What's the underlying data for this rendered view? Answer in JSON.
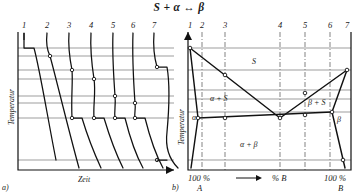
{
  "figure": {
    "title": "S + α ↔ β",
    "panel_a_label": "a)",
    "panel_b_label": "b)"
  },
  "panel_a": {
    "name": "cooling-curves",
    "y_axis_label": "Temperatur",
    "x_axis_label": "Zeit",
    "x_axis_arrow": true,
    "curve_numbers": [
      "1",
      "2",
      "3",
      "4",
      "5",
      "6",
      "7"
    ],
    "curve_number_x": [
      24,
      47,
      69,
      91,
      113,
      133,
      154
    ],
    "axis": {
      "x0": 18,
      "y0": 32,
      "x1": 174,
      "y1": 170
    },
    "curves": [
      {
        "id": "1",
        "start_x": 24,
        "break_y": 48,
        "arrest_end_x": 34,
        "end_x": 56,
        "end_y": 160
      },
      {
        "id": "2",
        "start_x": 47,
        "break_y": 56,
        "arrest_end_x": 57,
        "end_x": 79,
        "end_y": 168
      },
      {
        "id": "3",
        "start_x": 69,
        "break_y": 70,
        "arrest_end_x": 79,
        "end_x": 101,
        "end_y": 168
      },
      {
        "id": "4",
        "start_x": 91,
        "break_y": 79,
        "arrest_end_x": 101,
        "end_x": 123,
        "end_y": 168
      },
      {
        "id": "5",
        "start_x": 113,
        "break_y": 96,
        "arrest_end_x": 123,
        "end_x": 143,
        "end_y": 168
      },
      {
        "id": "6",
        "start_x": 133,
        "break_y": 103,
        "arrest_end_x": 143,
        "end_x": 163,
        "end_y": 168
      },
      {
        "id": "7",
        "start_x": 154,
        "break_y": 67,
        "arrest_end_x": 164,
        "end_x": 178,
        "end_y": 168
      }
    ]
  },
  "panel_b": {
    "name": "phase-diagram",
    "y_axis_label": "Temperatur",
    "x_axis_label": "% B",
    "x_axis_arrow": true,
    "left_end_label_top": "100 %",
    "left_end_label_bottom": "A",
    "right_end_label_top": "100 %",
    "right_end_label_bottom": "B",
    "alloy_numbers": [
      "1",
      "2",
      "3",
      "4",
      "5",
      "6",
      "7"
    ],
    "alloy_number_x": [
      190,
      202,
      225,
      280,
      305,
      330,
      346
    ],
    "phase_regions": [
      {
        "label": "S",
        "x": 252,
        "y": 64
      },
      {
        "label": "α + S",
        "x": 215,
        "y": 99
      },
      {
        "label": "β + S",
        "x": 313,
        "y": 103
      },
      {
        "label": "α",
        "x": 194,
        "y": 118
      },
      {
        "label": "β",
        "x": 338,
        "y": 120
      },
      {
        "label": "α + β",
        "x": 245,
        "y": 145
      }
    ],
    "box": {
      "x0": 188,
      "y0": 32,
      "x1": 351,
      "y1": 170
    },
    "liquidus_left": [
      [
        190,
        48
      ],
      [
        280,
        118
      ]
    ],
    "liquidus_right": [
      [
        280,
        118
      ],
      [
        347,
        70
      ]
    ],
    "solidus_left": [
      [
        190,
        48
      ],
      [
        198,
        118
      ]
    ],
    "solidus_right": [
      [
        347,
        70
      ],
      [
        332,
        112
      ]
    ],
    "eutectic_line": [
      [
        198,
        118
      ],
      [
        332,
        112
      ]
    ],
    "solvus_left": [
      [
        198,
        118
      ],
      [
        191,
        168
      ]
    ],
    "solvus_right": [
      [
        332,
        112
      ],
      [
        345,
        168
      ]
    ],
    "tie_lines_y": [
      48,
      70,
      90,
      99,
      112,
      118,
      160
    ]
  },
  "colors": {
    "ink": "#111111",
    "tie": "#8b8b8b",
    "dashdot": "#6e6e6e",
    "paper": "#ffffff"
  }
}
